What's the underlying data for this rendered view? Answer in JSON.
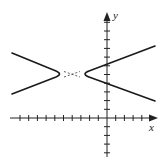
{
  "figure": {
    "type": "hyperbola-graph",
    "x_axis_label": "x",
    "y_axis_label": "y",
    "colors": {
      "curve": "#1a1a1a",
      "axis": "#222222",
      "background": "#ffffff"
    },
    "axes": {
      "origin_px": [
        107,
        118
      ],
      "tick_spacing_px": 8.7,
      "x_ticks_left": 10,
      "x_ticks_right": 4,
      "y_ticks_up": 11,
      "y_ticks_down": 4
    },
    "hyperbola": {
      "center": [
        -4,
        5
      ],
      "vertices": [
        [
          -5,
          5
        ],
        [
          -3,
          5
        ]
      ],
      "orientation": "horizontal",
      "asymptote_slope": 0.33
    }
  }
}
